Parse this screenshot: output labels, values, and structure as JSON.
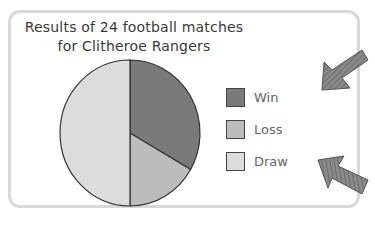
{
  "chart_data": {
    "type": "pie",
    "title": "Results of 24 football matches for Clitheroe Rangers",
    "title_lines": [
      "Results of 24 football matches",
      "for Clitheroe Rangers"
    ],
    "total": 24,
    "categories": [
      "Win",
      "Loss",
      "Draw"
    ],
    "values": [
      8,
      4,
      12
    ],
    "angles_deg": [
      120,
      60,
      180
    ],
    "colors": [
      "#7a7a7a",
      "#bcbcbc",
      "#dcdcdc"
    ],
    "start_angle": "12 o'clock, clockwise",
    "legend_position": "right"
  },
  "legend": {
    "items": [
      {
        "label": "Win",
        "color": "#7a7a7a"
      },
      {
        "label": "Loss",
        "color": "#bcbcbc"
      },
      {
        "label": "Draw",
        "color": "#dcdcdc"
      }
    ]
  }
}
